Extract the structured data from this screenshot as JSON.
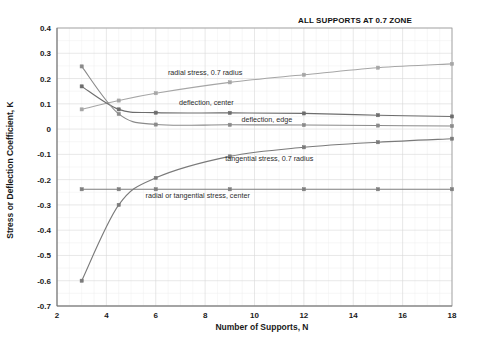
{
  "chart_data": {
    "type": "line",
    "title": "ALL SUPPORTS AT 0.7 ZONE",
    "xlabel": "Number of Supports, N",
    "ylabel": "Stress or Deflection Coefficient, K",
    "xlim": [
      2,
      18
    ],
    "ylim": [
      -0.7,
      0.4
    ],
    "xticks": [
      2,
      4,
      6,
      8,
      10,
      12,
      14,
      16,
      18
    ],
    "yticks": [
      -0.7,
      -0.6,
      -0.5,
      -0.4,
      -0.3,
      -0.2,
      -0.1,
      0,
      0.1,
      0.2,
      0.3,
      0.4
    ],
    "grid": true,
    "legend": "inline-annotations",
    "series": [
      {
        "name": "radial stress, 0.7 radius",
        "color": "#a6a6a6",
        "label_x": 8.0,
        "label_y": 0.215,
        "x": [
          3,
          4.5,
          6,
          9,
          12,
          15,
          18
        ],
        "values": [
          0.078,
          0.113,
          0.142,
          0.185,
          0.215,
          0.243,
          0.258
        ]
      },
      {
        "name": "deflection, center",
        "color": "#6d6d6d",
        "label_x": 8.05,
        "label_y": 0.094,
        "x": [
          3,
          4.5,
          6,
          9,
          12,
          15,
          18
        ],
        "values": [
          0.169,
          0.078,
          0.065,
          0.064,
          0.062,
          0.055,
          0.05
        ]
      },
      {
        "name": "deflection, edge",
        "color": "#8a8a8a",
        "label_x": 10.5,
        "label_y": 0.03,
        "x": [
          3,
          4.5,
          6,
          9,
          12,
          15,
          18
        ],
        "values": [
          0.248,
          0.06,
          0.018,
          0.017,
          0.016,
          0.014,
          0.012
        ]
      },
      {
        "name": "tangential stress, 0.7 radius",
        "color": "#7a7a7a",
        "label_x": 10.6,
        "label_y": -0.128,
        "x": [
          3,
          4.5,
          6,
          9,
          12,
          15,
          18
        ],
        "values": [
          -0.6,
          -0.3,
          -0.193,
          -0.108,
          -0.072,
          -0.052,
          -0.038
        ]
      },
      {
        "name": "radial or tangential stress, center",
        "color": "#7e7e7e",
        "label_x": 7.7,
        "label_y": -0.272,
        "x": [
          3,
          4.5,
          6,
          9,
          12,
          15,
          18
        ],
        "values": [
          -0.238,
          -0.238,
          -0.238,
          -0.238,
          -0.238,
          -0.238,
          -0.238
        ]
      }
    ]
  }
}
